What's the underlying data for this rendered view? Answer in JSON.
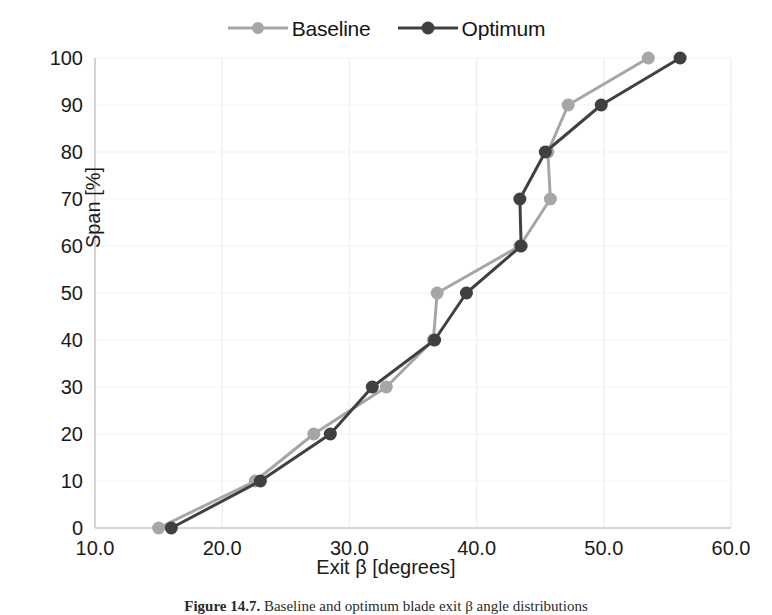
{
  "figure": {
    "caption_prefix": "Figure 14.7.",
    "caption_text": " Baseline and optimum blade exit β angle distributions"
  },
  "legend": {
    "position": "top-center",
    "entries": [
      {
        "label": "Baseline",
        "color": "#a6a6a6",
        "marker": "circle",
        "symbol_name": "legend-line-marker"
      },
      {
        "label": "Optimum",
        "color": "#404040",
        "marker": "circle",
        "symbol_name": "legend-line-marker"
      }
    ]
  },
  "chart_data": {
    "type": "line",
    "title": "",
    "xlabel": "Exit β [degrees]",
    "ylabel": "Span [%]",
    "xlim": [
      10.0,
      60.0
    ],
    "ylim": [
      0,
      100
    ],
    "xticks": [
      "10.0",
      "20.0",
      "30.0",
      "40.0",
      "50.0",
      "60.0"
    ],
    "xtick_values": [
      10.0,
      20.0,
      30.0,
      40.0,
      50.0,
      60.0
    ],
    "yticks": [
      "0",
      "10",
      "20",
      "30",
      "40",
      "50",
      "60",
      "70",
      "80",
      "90",
      "100"
    ],
    "ytick_values": [
      0,
      10,
      20,
      30,
      40,
      50,
      60,
      70,
      80,
      90,
      100
    ],
    "grid": "both-faint",
    "legend_position": "top-center",
    "marker": "circle",
    "series": [
      {
        "name": "Baseline",
        "color": "#a6a6a6",
        "x": [
          15.0,
          22.6,
          27.2,
          32.9,
          36.6,
          36.9,
          43.4,
          45.8,
          45.6,
          47.2,
          53.5
        ],
        "y": [
          0,
          10,
          20,
          30,
          40,
          50,
          60,
          70,
          80,
          90,
          100
        ]
      },
      {
        "name": "Optimum",
        "color": "#404040",
        "x": [
          16.0,
          23.0,
          28.5,
          31.8,
          36.7,
          39.2,
          43.5,
          43.4,
          45.4,
          49.8,
          56.0
        ],
        "y": [
          0,
          10,
          20,
          30,
          40,
          50,
          60,
          70,
          80,
          90,
          100
        ]
      }
    ]
  }
}
